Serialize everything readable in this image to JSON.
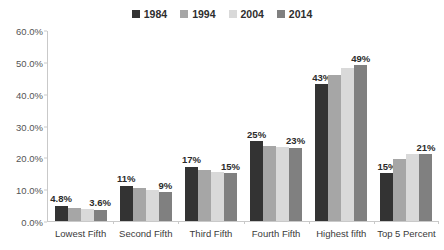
{
  "chart_data": {
    "type": "bar",
    "title": "",
    "xlabel": "",
    "ylabel": "",
    "ylim": [
      0,
      60
    ],
    "ytick_labels": [
      "0.0%",
      "10.0%",
      "20.0%",
      "30.0%",
      "40.0%",
      "50.0%",
      "60.0%"
    ],
    "ytick_values": [
      0,
      10,
      20,
      30,
      40,
      50,
      60
    ],
    "grid": false,
    "legend_position": "top-center",
    "categories": [
      "Lowest Fifth",
      "Second Fifth",
      "Third Fifth",
      "Fourth Fifth",
      "Highest fifth",
      "Top 5 Percent"
    ],
    "series": [
      {
        "name": "1984",
        "color": "#333333",
        "values": [
          4.8,
          11.0,
          17.0,
          25.0,
          43.0,
          15.0
        ],
        "labels": [
          "4.8%",
          "11%",
          "17%",
          "25%",
          "43%",
          "15%"
        ]
      },
      {
        "name": "1994",
        "color": "#a6a6a6",
        "values": [
          4.2,
          10.4,
          15.9,
          23.6,
          46.0,
          19.5
        ],
        "labels": [
          "",
          "",
          "",
          "",
          "",
          ""
        ]
      },
      {
        "name": "2004",
        "color": "#d9d9d9",
        "values": [
          3.9,
          9.8,
          15.5,
          23.2,
          48.0,
          21.0
        ],
        "labels": [
          "",
          "",
          "",
          "",
          "",
          ""
        ]
      },
      {
        "name": "2014",
        "color": "#808080",
        "values": [
          3.6,
          9.0,
          15.0,
          23.0,
          49.0,
          21.0
        ],
        "labels": [
          "3.6%",
          "9%",
          "15%",
          "23%",
          "49%",
          "21%"
        ]
      }
    ],
    "axis_color": "#c9c9c9"
  }
}
